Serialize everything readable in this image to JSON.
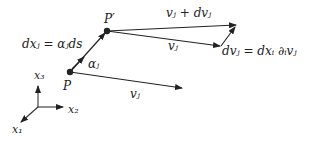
{
  "diagram": {
    "labels": {
      "p": "P",
      "p_prime": "P′",
      "dx": "dxⱼ = αⱼds",
      "alpha": "αⱼ",
      "v_plus_dv": "vⱼ + dvⱼ",
      "v_upper": "vⱼ",
      "v_lower": "vⱼ",
      "dv": "dvⱼ = dxᵢ ∂ᵢvⱼ",
      "x1": "x₁",
      "x2": "x₂",
      "x3": "x₃"
    },
    "colors": {
      "stroke": "#222222",
      "background": "#ffffff"
    }
  }
}
